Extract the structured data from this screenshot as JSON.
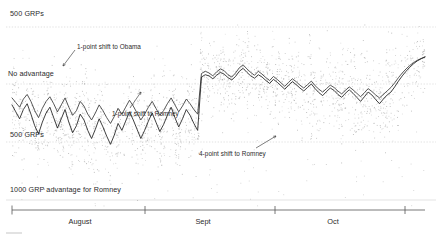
{
  "chart_data": {
    "type": "line",
    "title": "",
    "subtitle": "",
    "xlabel": "",
    "ylabel": "GRPs (Gross Rating Points) advantage",
    "grid": true,
    "legend_position": "none",
    "gridlines": [
      {
        "label": "500 GRPs",
        "value": 500,
        "y_px": 27
      },
      {
        "label": "No advantage",
        "value": 0,
        "y_px": 84
      },
      {
        "label": "500 GRPs",
        "value": -500,
        "y_px": 142
      },
      {
        "label": "1000 GRP advantage for Romney",
        "value": -1000,
        "y_px": 200
      }
    ],
    "x_axis": {
      "ticks": [
        {
          "label": "",
          "x_px": 12
        },
        {
          "label": "",
          "x_px": 145
        },
        {
          "label": "",
          "x_px": 275
        },
        {
          "label": "",
          "x_px": 405
        }
      ],
      "tick_labels": [
        "August",
        "Sept",
        "Oct"
      ],
      "range_px": [
        12,
        425
      ]
    },
    "annotations": [
      {
        "text": "1-point shift to Obama",
        "x_px": 77,
        "y_px": 43,
        "arrow_to_x": 66,
        "arrow_to_y": 66
      },
      {
        "text": "1-point shift to Romney",
        "x_px": 112,
        "y_px": 110,
        "arrow_to_x": 106,
        "arrow_to_y": 96
      },
      {
        "text": "4-point shift to Romney",
        "x_px": 199,
        "y_px": 150,
        "arrow_to_x": 252,
        "arrow_to_y": 140
      }
    ],
    "series": [
      {
        "name": "upper-trend-line",
        "color": "#3a3a3a",
        "values": [
          -120,
          -160,
          -200,
          -130,
          -90,
          -150,
          -230,
          -290,
          -210,
          -150,
          -110,
          -170,
          -240,
          -180,
          -120,
          -200,
          -270,
          -230,
          -150,
          -190,
          -260,
          -310,
          -250,
          -180,
          -230,
          -290,
          -340,
          -280,
          -210,
          -260,
          -200,
          -140,
          -190,
          -250,
          -310,
          -260,
          -200,
          -150,
          -210,
          -270,
          -230,
          -170,
          -120,
          -180,
          -240,
          -190,
          -130,
          -170,
          -220,
          -260,
          90,
          110,
          95,
          70,
          105,
          130,
          115,
          80,
          60,
          95,
          140,
          165,
          130,
          100,
          75,
          110,
          85,
          55,
          30,
          65,
          40,
          10,
          -20,
          15,
          45,
          20,
          -10,
          -35,
          -5,
          25,
          -15,
          -45,
          -70,
          -40,
          -10,
          -30,
          -60,
          -85,
          -55,
          -25,
          -50,
          -80,
          -110,
          -75,
          -40,
          -65,
          -95,
          -120,
          -90,
          -60,
          -30,
          10,
          55,
          95,
          130,
          160,
          185,
          205,
          220,
          235
        ]
      },
      {
        "name": "lower-trend-line",
        "color": "#1f1f1f",
        "values": [
          -180,
          -240,
          -300,
          -220,
          -170,
          -260,
          -360,
          -430,
          -330,
          -250,
          -200,
          -290,
          -380,
          -300,
          -220,
          -330,
          -420,
          -360,
          -260,
          -310,
          -400,
          -470,
          -390,
          -300,
          -370,
          -450,
          -520,
          -440,
          -340,
          -400,
          -320,
          -240,
          -310,
          -390,
          -470,
          -400,
          -320,
          -250,
          -330,
          -410,
          -350,
          -270,
          -200,
          -290,
          -370,
          -300,
          -220,
          -270,
          -340,
          -400,
          60,
          80,
          70,
          45,
          75,
          100,
          85,
          55,
          35,
          65,
          110,
          135,
          100,
          70,
          50,
          80,
          60,
          30,
          5,
          40,
          15,
          -15,
          -45,
          -10,
          20,
          -5,
          -35,
          -60,
          -30,
          0,
          -40,
          -75,
          -100,
          -65,
          -35,
          -55,
          -90,
          -115,
          -80,
          -50,
          -80,
          -115,
          -150,
          -110,
          -70,
          -95,
          -135,
          -170,
          -130,
          -95,
          -70,
          -25,
          25,
          70,
          110,
          145,
          175,
          200,
          218,
          232
        ]
      }
    ],
    "scatter_note": "dense grey vertical scatter columns of individual market GRP values behind the trend lines"
  },
  "labels": {
    "grp_top": "500 GRPs",
    "no_advantage": "No advantage",
    "grp_bottom": "500 GRPs",
    "romney_1000": "1000 GRP advantage for Romney"
  },
  "annotations": {
    "obama_1pt": "1-point shift to Obama",
    "romney_1pt": "1-point shift to Romney",
    "romney_4pt": "4-point shift to Romney"
  },
  "axis": {
    "month_august": "August",
    "month_sept": "Sept",
    "month_oct": "Oct"
  },
  "colors": {
    "gridline": "#c9c9c9",
    "scatter": "#9a9a9a",
    "line_upper": "#3a3a3a",
    "line_lower": "#1f1f1f",
    "text": "#2b2b2b",
    "axis": "#555555"
  }
}
